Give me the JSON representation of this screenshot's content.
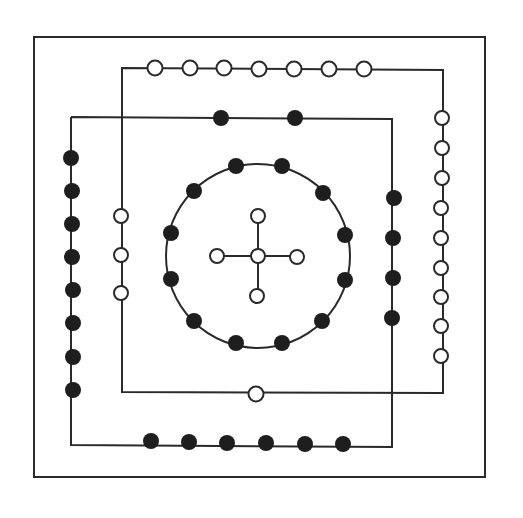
{
  "diagram": {
    "title": "",
    "colors": {
      "line": "#2a2a2a",
      "black_dot": "#1e1e1e",
      "white_dot": "#ffffff",
      "background": "#ffffff"
    },
    "groups": [
      {
        "name": "top-outer",
        "color": "white",
        "count": 7
      },
      {
        "name": "top-inner",
        "color": "black",
        "count": 2
      },
      {
        "name": "left-outer",
        "color": "black",
        "count": 8
      },
      {
        "name": "left-inner",
        "color": "white",
        "count": 3
      },
      {
        "name": "right-outer",
        "color": "white",
        "count": 9
      },
      {
        "name": "right-inner",
        "color": "black",
        "count": 4
      },
      {
        "name": "bottom-outer",
        "color": "black",
        "count": 6
      },
      {
        "name": "bottom-inner",
        "color": "white",
        "count": 1
      },
      {
        "name": "center-circle",
        "color": "black",
        "count": 10
      },
      {
        "name": "center-cross",
        "color": "white",
        "count": 5
      }
    ]
  }
}
